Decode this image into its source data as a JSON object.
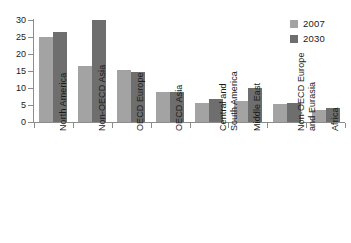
{
  "chart_data": {
    "type": "bar",
    "title": "",
    "subtitle": "",
    "xlabel": "",
    "ylabel": "",
    "ylim": [
      0,
      30
    ],
    "ytick_step": 5,
    "yticks": [
      0,
      5,
      10,
      15,
      20,
      25,
      30
    ],
    "ytick_labels": [
      "0",
      "5",
      "10",
      "15",
      "20",
      "25",
      "30"
    ],
    "grid": false,
    "legend_position": "top-right",
    "categories": [
      "North America",
      "Non-OECD Asia",
      "OECD Europe",
      "OECD Asia",
      "Central and South America",
      "Middle East",
      "Non-OECD Europe and Eurasia",
      "Africa"
    ],
    "category_lines": [
      [
        "North America"
      ],
      [
        "Non-OECD Asia"
      ],
      [
        "OECD Europe"
      ],
      [
        "OECD Asia"
      ],
      [
        "Central and",
        "South America"
      ],
      [
        "Middle East"
      ],
      [
        "Non-OECD Europe",
        "and Eurasia"
      ],
      [
        "Africa"
      ]
    ],
    "series": [
      {
        "name": "2007",
        "color": "#a3a3a3",
        "values": [
          25.0,
          16.5,
          15.2,
          8.8,
          5.6,
          6.2,
          5.2,
          3.4
        ]
      },
      {
        "name": "2030",
        "color": "#6e6e6e",
        "values": [
          26.6,
          29.9,
          14.7,
          8.7,
          6.7,
          10.1,
          5.5,
          4.0
        ]
      }
    ]
  },
  "legend": {
    "items": [
      {
        "label": "2007",
        "color": "#a3a3a3"
      },
      {
        "label": "2030",
        "color": "#6e6e6e"
      }
    ]
  },
  "axes": {
    "y_axis_color": "#8c8c8c",
    "x_axis_color": "#8c8c8c"
  }
}
